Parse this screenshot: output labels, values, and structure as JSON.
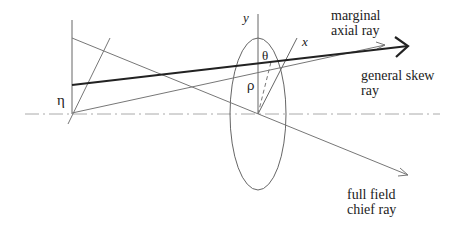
{
  "diagram": {
    "type": "optical ray-tracing schematic",
    "labels": {
      "marginal": "marginal\naxial ray",
      "skew": "general skew\nray",
      "chief": "full field\nchief ray",
      "eta": "η",
      "theta": "θ",
      "rho": "ρ",
      "y_axis": "y",
      "x_axis": "x"
    },
    "colors": {
      "line": "#555555",
      "thick_ray": "#222222",
      "axis": "#999999",
      "text": "#222222"
    }
  }
}
